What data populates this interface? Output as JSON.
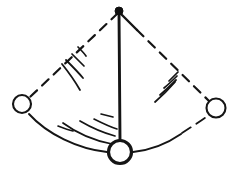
{
  "figure": {
    "kind": "line-drawing",
    "background_color": "#ffffff",
    "ink_color": "#151515",
    "canvas": {
      "width": 238,
      "height": 174
    }
  },
  "labels": {
    "pivot": "pivot point",
    "rod_rest": "pendulum rod at rest",
    "rod_left": "pendulum rod at left extreme",
    "rod_right": "pendulum rod at right extreme",
    "bob_rest": "pendulum bob at rest",
    "bob_left": "pendulum bob at left extreme",
    "bob_right": "pendulum bob at right extreme",
    "swing_arc": "swing path arc",
    "motion_lines": "motion speed lines"
  },
  "chart_data": {
    "type": "diagram",
    "pivot": {
      "x": 119,
      "y": 11,
      "radius": 4
    },
    "bobs": [
      {
        "name": "bob-left",
        "x": 22,
        "y": 104,
        "radius": 9,
        "stroke_width": 2.1,
        "fill": "#ffffff"
      },
      {
        "name": "bob-right",
        "x": 216,
        "y": 108,
        "radius": 9.5,
        "stroke_width": 2.1,
        "fill": "#ffffff"
      },
      {
        "name": "bob-rest",
        "x": 120,
        "y": 152,
        "radius": 11.5,
        "stroke_width": 3.2,
        "fill": "#ffffff"
      }
    ],
    "rods": [
      {
        "name": "rod-rest",
        "from": [
          119,
          11
        ],
        "to": [
          120,
          141
        ],
        "style": "solid",
        "stroke_width": 2.8
      },
      {
        "name": "rod-left",
        "from": [
          119,
          11
        ],
        "to": [
          29,
          98
        ],
        "style": "dashed",
        "stroke_width": 2.2,
        "dash": "9 7"
      },
      {
        "name": "rod-right",
        "from": [
          119,
          11
        ],
        "to": [
          209,
          101
        ],
        "style": "dashed",
        "stroke_width": 2.2,
        "dash": "9 7"
      }
    ],
    "arcs": [
      {
        "name": "arc-left",
        "from": [
          28,
          113
        ],
        "to": [
          109,
          152
        ],
        "style": "solid",
        "stroke_width": 1.9
      },
      {
        "name": "arc-right",
        "from": [
          132,
          152
        ],
        "to": [
          209,
          116
        ],
        "style": "solid-to-dashed",
        "stroke_width": 1.9
      }
    ],
    "motion_lines_count": 12,
    "grid": false,
    "legend": false
  }
}
